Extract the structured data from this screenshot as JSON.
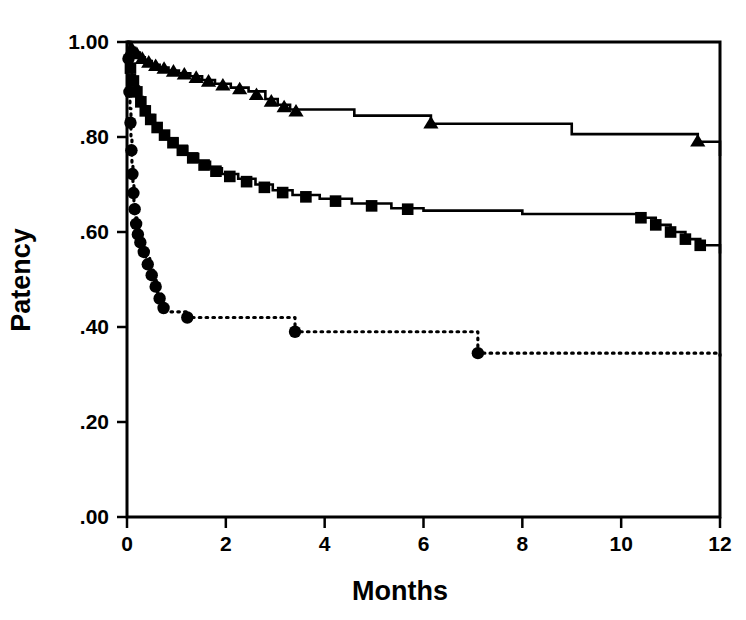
{
  "figure": {
    "title": "",
    "background_color": "#ffffff",
    "foreground_color": "#000000"
  },
  "axes": {
    "x_title": "Months",
    "y_title": "Patency",
    "x_ticks": [
      "0",
      "2",
      "4",
      "6",
      "8",
      "10",
      "12"
    ],
    "y_ticks": [
      "1.00",
      ".80",
      ".60",
      ".40",
      ".20",
      ".00"
    ]
  },
  "chart_data": {
    "type": "line",
    "title": "",
    "subtitle": "",
    "xlabel": "Months",
    "ylabel": "Patency",
    "xlim": [
      0,
      12
    ],
    "ylim": [
      0.0,
      1.0
    ],
    "xticks": [
      0,
      2,
      4,
      6,
      8,
      10,
      12
    ],
    "xticklabels": [
      "0",
      "2",
      "4",
      "6",
      "8",
      "10",
      "12"
    ],
    "yticks": [
      0.0,
      0.2,
      0.4,
      0.6,
      0.8,
      1.0
    ],
    "yticklabels": [
      ".00",
      ".20",
      ".40",
      ".60",
      ".80",
      "1.00"
    ],
    "grid": false,
    "legend": "none",
    "legend_position": "none",
    "plot_style": "kaplan-meier step curves with markers",
    "series": [
      {
        "name": "triangle-series",
        "marker": "triangle",
        "linestyle": "solid",
        "color": "#000000",
        "start_value": 1.0,
        "end_value": 0.76,
        "points": [
          {
            "x": 0.0,
            "y": 1.0
          },
          {
            "x": 0.08,
            "y": 0.988
          },
          {
            "x": 0.16,
            "y": 0.978
          },
          {
            "x": 0.26,
            "y": 0.968
          },
          {
            "x": 0.36,
            "y": 0.96
          },
          {
            "x": 0.5,
            "y": 0.952
          },
          {
            "x": 0.66,
            "y": 0.946
          },
          {
            "x": 0.84,
            "y": 0.94
          },
          {
            "x": 1.05,
            "y": 0.934
          },
          {
            "x": 1.28,
            "y": 0.928
          },
          {
            "x": 1.52,
            "y": 0.92
          },
          {
            "x": 1.78,
            "y": 0.912
          },
          {
            "x": 2.1,
            "y": 0.904
          },
          {
            "x": 2.46,
            "y": 0.896
          },
          {
            "x": 2.8,
            "y": 0.88
          },
          {
            "x": 3.05,
            "y": 0.868
          },
          {
            "x": 3.3,
            "y": 0.858
          },
          {
            "x": 4.6,
            "y": 0.845
          },
          {
            "x": 6.15,
            "y": 0.828
          },
          {
            "x": 9.0,
            "y": 0.806
          },
          {
            "x": 11.55,
            "y": 0.79
          },
          {
            "x": 12.0,
            "y": 0.76
          }
        ],
        "marker_points": [
          {
            "x": 0.1,
            "y": 0.984
          },
          {
            "x": 0.2,
            "y": 0.974
          },
          {
            "x": 0.31,
            "y": 0.964
          },
          {
            "x": 0.44,
            "y": 0.956
          },
          {
            "x": 0.58,
            "y": 0.949
          },
          {
            "x": 0.75,
            "y": 0.943
          },
          {
            "x": 0.94,
            "y": 0.937
          },
          {
            "x": 1.16,
            "y": 0.931
          },
          {
            "x": 1.4,
            "y": 0.924
          },
          {
            "x": 1.65,
            "y": 0.916
          },
          {
            "x": 1.94,
            "y": 0.908
          },
          {
            "x": 2.28,
            "y": 0.9
          },
          {
            "x": 2.62,
            "y": 0.888
          },
          {
            "x": 2.92,
            "y": 0.874
          },
          {
            "x": 3.18,
            "y": 0.862
          },
          {
            "x": 3.42,
            "y": 0.853
          },
          {
            "x": 6.15,
            "y": 0.828
          },
          {
            "x": 11.55,
            "y": 0.79
          }
        ]
      },
      {
        "name": "square-series",
        "marker": "square",
        "linestyle": "solid",
        "color": "#000000",
        "start_value": 1.0,
        "end_value": 0.555,
        "points": [
          {
            "x": 0.0,
            "y": 1.0
          },
          {
            "x": 0.05,
            "y": 0.96
          },
          {
            "x": 0.1,
            "y": 0.93
          },
          {
            "x": 0.16,
            "y": 0.906
          },
          {
            "x": 0.24,
            "y": 0.884
          },
          {
            "x": 0.32,
            "y": 0.864
          },
          {
            "x": 0.42,
            "y": 0.846
          },
          {
            "x": 0.54,
            "y": 0.828
          },
          {
            "x": 0.68,
            "y": 0.812
          },
          {
            "x": 0.84,
            "y": 0.796
          },
          {
            "x": 1.02,
            "y": 0.78
          },
          {
            "x": 1.22,
            "y": 0.764
          },
          {
            "x": 1.44,
            "y": 0.748
          },
          {
            "x": 1.68,
            "y": 0.734
          },
          {
            "x": 1.92,
            "y": 0.722
          },
          {
            "x": 2.25,
            "y": 0.712
          },
          {
            "x": 2.6,
            "y": 0.7
          },
          {
            "x": 2.95,
            "y": 0.688
          },
          {
            "x": 3.35,
            "y": 0.678
          },
          {
            "x": 3.9,
            "y": 0.67
          },
          {
            "x": 4.55,
            "y": 0.66
          },
          {
            "x": 5.35,
            "y": 0.65
          },
          {
            "x": 6.0,
            "y": 0.645
          },
          {
            "x": 8.0,
            "y": 0.638
          },
          {
            "x": 10.4,
            "y": 0.63
          },
          {
            "x": 10.7,
            "y": 0.615
          },
          {
            "x": 11.0,
            "y": 0.6
          },
          {
            "x": 11.3,
            "y": 0.585
          },
          {
            "x": 11.6,
            "y": 0.572
          },
          {
            "x": 12.0,
            "y": 0.555
          }
        ],
        "marker_points": [
          {
            "x": 0.07,
            "y": 0.945
          },
          {
            "x": 0.13,
            "y": 0.918
          },
          {
            "x": 0.2,
            "y": 0.895
          },
          {
            "x": 0.28,
            "y": 0.874
          },
          {
            "x": 0.37,
            "y": 0.855
          },
          {
            "x": 0.48,
            "y": 0.837
          },
          {
            "x": 0.61,
            "y": 0.82
          },
          {
            "x": 0.76,
            "y": 0.804
          },
          {
            "x": 0.93,
            "y": 0.788
          },
          {
            "x": 1.12,
            "y": 0.772
          },
          {
            "x": 1.33,
            "y": 0.756
          },
          {
            "x": 1.56,
            "y": 0.741
          },
          {
            "x": 1.8,
            "y": 0.728
          },
          {
            "x": 2.08,
            "y": 0.717
          },
          {
            "x": 2.42,
            "y": 0.706
          },
          {
            "x": 2.78,
            "y": 0.694
          },
          {
            "x": 3.15,
            "y": 0.683
          },
          {
            "x": 3.62,
            "y": 0.674
          },
          {
            "x": 4.22,
            "y": 0.665
          },
          {
            "x": 4.95,
            "y": 0.655
          },
          {
            "x": 5.68,
            "y": 0.648
          },
          {
            "x": 10.4,
            "y": 0.63
          },
          {
            "x": 10.7,
            "y": 0.615
          },
          {
            "x": 11.0,
            "y": 0.6
          },
          {
            "x": 11.3,
            "y": 0.585
          },
          {
            "x": 11.6,
            "y": 0.572
          }
        ]
      },
      {
        "name": "circle-series",
        "marker": "circle",
        "linestyle": "dotted",
        "color": "#000000",
        "start_value": 1.0,
        "end_value": 0.34,
        "points": [
          {
            "x": 0.02,
            "y": 1.0
          },
          {
            "x": 0.04,
            "y": 0.93
          },
          {
            "x": 0.06,
            "y": 0.86
          },
          {
            "x": 0.08,
            "y": 0.8
          },
          {
            "x": 0.1,
            "y": 0.745
          },
          {
            "x": 0.12,
            "y": 0.7
          },
          {
            "x": 0.14,
            "y": 0.665
          },
          {
            "x": 0.17,
            "y": 0.63
          },
          {
            "x": 0.2,
            "y": 0.605
          },
          {
            "x": 0.24,
            "y": 0.586
          },
          {
            "x": 0.3,
            "y": 0.57
          },
          {
            "x": 0.38,
            "y": 0.545
          },
          {
            "x": 0.46,
            "y": 0.52
          },
          {
            "x": 0.54,
            "y": 0.498
          },
          {
            "x": 0.62,
            "y": 0.472
          },
          {
            "x": 0.7,
            "y": 0.448
          },
          {
            "x": 0.78,
            "y": 0.432
          },
          {
            "x": 1.22,
            "y": 0.42
          },
          {
            "x": 3.4,
            "y": 0.39
          },
          {
            "x": 7.1,
            "y": 0.345
          },
          {
            "x": 12.0,
            "y": 0.34
          }
        ],
        "marker_points": [
          {
            "x": 0.03,
            "y": 0.965
          },
          {
            "x": 0.05,
            "y": 0.895
          },
          {
            "x": 0.07,
            "y": 0.83
          },
          {
            "x": 0.09,
            "y": 0.772
          },
          {
            "x": 0.11,
            "y": 0.722
          },
          {
            "x": 0.13,
            "y": 0.682
          },
          {
            "x": 0.155,
            "y": 0.648
          },
          {
            "x": 0.185,
            "y": 0.617
          },
          {
            "x": 0.22,
            "y": 0.595
          },
          {
            "x": 0.27,
            "y": 0.578
          },
          {
            "x": 0.34,
            "y": 0.558
          },
          {
            "x": 0.42,
            "y": 0.532
          },
          {
            "x": 0.5,
            "y": 0.509
          },
          {
            "x": 0.58,
            "y": 0.485
          },
          {
            "x": 0.66,
            "y": 0.46
          },
          {
            "x": 0.74,
            "y": 0.44
          },
          {
            "x": 1.22,
            "y": 0.42
          },
          {
            "x": 3.4,
            "y": 0.39
          },
          {
            "x": 7.1,
            "y": 0.345
          }
        ]
      }
    ]
  },
  "geometry": {
    "plot_left": 127,
    "plot_right": 720,
    "plot_top": 42,
    "plot_bottom": 517
  }
}
